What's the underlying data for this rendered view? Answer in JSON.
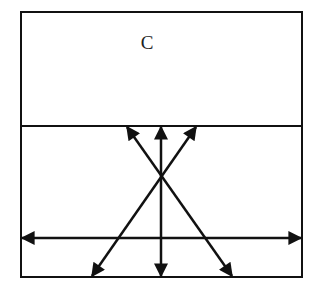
{
  "diagram": {
    "top_region_label": "C",
    "colors": {
      "stroke": "#111111",
      "background": "#ffffff"
    },
    "outer_box": {
      "left": 21,
      "top": 12,
      "right": 302,
      "bottom": 277
    },
    "divider_y": 126,
    "arrows": [
      {
        "name": "horizontal-double-arrow",
        "x1": 22,
        "y1": 238,
        "x2": 301,
        "y2": 238,
        "double": true
      },
      {
        "name": "vertical-double-arrow",
        "x1": 161,
        "y1": 127,
        "x2": 161,
        "y2": 276,
        "double": true
      },
      {
        "name": "diagonal-left-up-double-arrow",
        "x1": 127,
        "y1": 127,
        "x2": 232,
        "y2": 276,
        "double": true
      },
      {
        "name": "diagonal-right-up-double-arrow",
        "x1": 196,
        "y1": 127,
        "x2": 92,
        "y2": 276,
        "double": true
      }
    ]
  }
}
